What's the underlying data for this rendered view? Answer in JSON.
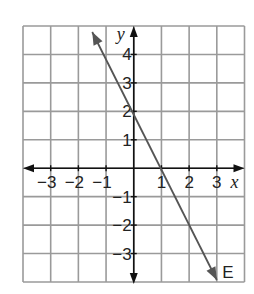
{
  "chart_data": {
    "type": "line",
    "title": "",
    "xlabel": "x",
    "ylabel": "y",
    "xlim": [
      -4,
      4
    ],
    "ylim": [
      -4,
      5
    ],
    "grid": true,
    "x_ticks": [
      -3,
      -2,
      -1,
      1,
      2,
      3
    ],
    "y_ticks": [
      4,
      3,
      2,
      1,
      -1,
      -2,
      -3
    ],
    "x_tick_labels": [
      "−3",
      "−2",
      "−1",
      "1",
      "2",
      "3"
    ],
    "y_tick_labels": [
      "4",
      "3",
      "2",
      "1",
      "−1",
      "−2",
      "−3"
    ],
    "series": [
      {
        "name": "E",
        "equation": "y = -2x + 2",
        "slope": -2,
        "y_intercept": 2,
        "x_intercept": 1,
        "points": [
          [
            -1.5,
            5
          ],
          [
            0,
            2
          ],
          [
            1,
            0
          ],
          [
            3,
            -4
          ]
        ],
        "arrows_both_ends": true
      }
    ],
    "annotations": [
      {
        "text": "E",
        "x": 3.3,
        "y": -3.6
      }
    ]
  },
  "colors": {
    "grid": "#9a9a9a",
    "axes": "#111111",
    "line": "#555555",
    "background": "#ffffff"
  },
  "labels": {
    "x_axis": "x",
    "y_axis": "y",
    "line_label": "E"
  }
}
